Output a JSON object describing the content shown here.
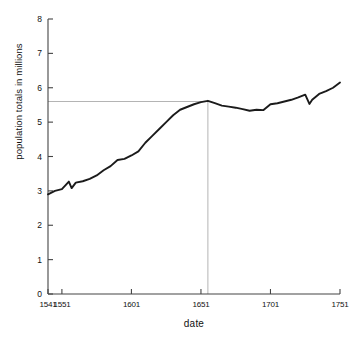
{
  "chart_data": {
    "type": "line",
    "title": "",
    "xlabel": "date",
    "ylabel": "population totals in millions",
    "xlim": [
      1541,
      1751
    ],
    "ylim": [
      0,
      8
    ],
    "grid": false,
    "legend": null,
    "xticks": [
      1541,
      1551,
      1601,
      1651,
      1701,
      1751
    ],
    "xtick_labels": [
      "1541",
      "1551",
      "1601",
      "1651",
      "1701",
      "1751"
    ],
    "yticks": [
      0,
      1,
      2,
      3,
      4,
      5,
      6,
      7,
      8
    ],
    "ytick_labels": [
      "0",
      "1",
      "2",
      "3",
      "4",
      "5",
      "6",
      "7",
      "8"
    ],
    "series": [
      {
        "name": "population totals",
        "color": "#1b1b1b",
        "x": [
          1541,
          1546,
          1551,
          1556,
          1558,
          1561,
          1566,
          1571,
          1576,
          1581,
          1586,
          1591,
          1596,
          1601,
          1606,
          1611,
          1616,
          1621,
          1626,
          1631,
          1636,
          1641,
          1646,
          1651,
          1656,
          1661,
          1666,
          1671,
          1676,
          1681,
          1686,
          1691,
          1696,
          1701,
          1706,
          1711,
          1716,
          1721,
          1726,
          1729,
          1731,
          1736,
          1741,
          1746,
          1751
        ],
        "y": [
          2.9,
          3.0,
          3.05,
          3.27,
          3.08,
          3.24,
          3.28,
          3.35,
          3.45,
          3.6,
          3.72,
          3.9,
          3.93,
          4.03,
          4.15,
          4.4,
          4.6,
          4.8,
          5.0,
          5.2,
          5.36,
          5.44,
          5.52,
          5.58,
          5.62,
          5.55,
          5.48,
          5.45,
          5.42,
          5.38,
          5.33,
          5.36,
          5.35,
          5.52,
          5.55,
          5.6,
          5.65,
          5.72,
          5.8,
          5.53,
          5.65,
          5.82,
          5.9,
          6.0,
          6.15
        ]
      }
    ],
    "annotations": {
      "reference_value": 5.6,
      "reference_year": 1656,
      "reference_line_color": "#b4b4b4",
      "description_h": "horizontal guide at about 5.6 million",
      "description_v": "vertical guide dropping to the date axis just after 1651"
    }
  },
  "axes": {
    "axis_color": "#444444"
  }
}
